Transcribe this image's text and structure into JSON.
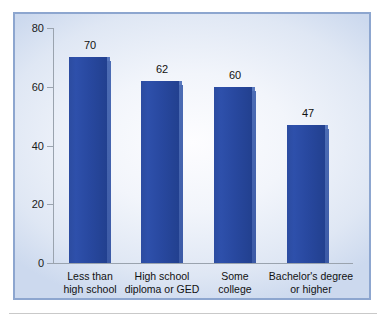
{
  "chart_data": {
    "type": "bar",
    "title": "",
    "subtitle": "",
    "xlabel": "",
    "ylabel": "",
    "ylim": [
      0,
      80
    ],
    "ytick_step": 20,
    "yticks": [
      "0",
      "20",
      "40",
      "60",
      "80"
    ],
    "grid": false,
    "legend": null,
    "categories": [
      "Less than high school",
      "High school diploma or GED",
      "Some college",
      "Bachelor's degree or higher"
    ],
    "category_lines": [
      [
        "Less than",
        "high school"
      ],
      [
        "High school",
        "diploma or GED"
      ],
      [
        "Some",
        "college"
      ],
      [
        "Bachelor's degree",
        "or higher"
      ]
    ],
    "values": [
      70,
      62,
      60,
      47
    ],
    "value_labels": [
      "70",
      "62",
      "60",
      "47"
    ],
    "bar_color": "#2c4ca0",
    "bar_top_color": "#5878be",
    "bar_side_color": "#3c5aa6",
    "panel_border_color": "#8da6cf",
    "panel_background_color": "#eaf0fa",
    "axis_color": "#9aa3ae",
    "text_color": "#111111"
  }
}
